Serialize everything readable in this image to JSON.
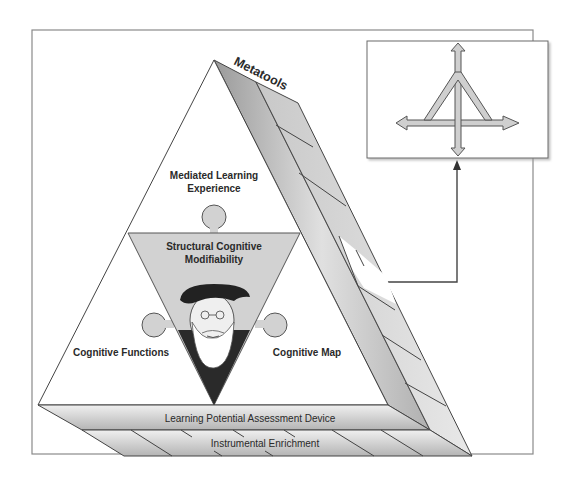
{
  "diagram": {
    "title_band": "Metatools",
    "apex_region": {
      "line1": "Mediated Learning",
      "line2": "Experience"
    },
    "center_region": {
      "line1": "Structural Cognitive",
      "line2": "Modifiability",
      "portrait": "bearded-man-portrait"
    },
    "left_region": "Cognitive Functions",
    "right_region": "Cognitive Map",
    "base_band_upper": "Learning Potential Assessment Device",
    "base_band_lower": "Instrumental Enrichment",
    "inset_box": {
      "icon": "four-way-arrow-triangle-icon",
      "description": "arrow connector from right band to inset"
    },
    "colors": {
      "frame": "#8a8a8a",
      "band_light": "#e6e6e6",
      "band_dark": "#a8a8a8",
      "inner_triangle": "#d2d2d2",
      "arrow_fill": "#cfcfcf",
      "stroke": "#3a3a3a"
    }
  }
}
